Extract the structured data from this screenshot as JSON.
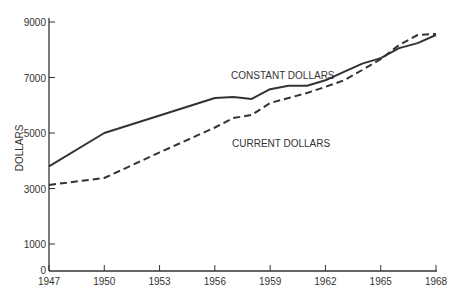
{
  "chart_data": {
    "type": "line",
    "title": "",
    "xlabel": "",
    "ylabel": "DOLLARS",
    "x_ticks": [
      "1947",
      "1950",
      "1953",
      "1956",
      "1959",
      "1962",
      "1965",
      "1968"
    ],
    "y_ticks": [
      "0",
      "1000",
      "3000",
      "5000",
      "7000",
      "9000"
    ],
    "ylim": [
      0,
      9000
    ],
    "xlim": [
      1947,
      1968
    ],
    "grid": false,
    "legend": "inline labels",
    "series": [
      {
        "name": "CONSTANT DOLLARS",
        "style": "solid",
        "x": [
          1947,
          1950,
          1956,
          1957,
          1958,
          1959,
          1960,
          1961,
          1962,
          1963,
          1964,
          1965,
          1966,
          1967,
          1968
        ],
        "values": [
          3800,
          5000,
          6260,
          6300,
          6230,
          6580,
          6700,
          6700,
          6900,
          7200,
          7500,
          7700,
          8060,
          8240,
          8530
        ]
      },
      {
        "name": "CURRENT DOLLARS",
        "style": "dashed",
        "x": [
          1947,
          1950,
          1953,
          1956,
          1957,
          1958,
          1959,
          1960,
          1961,
          1962,
          1963,
          1964,
          1965,
          1966,
          1967,
          1968
        ],
        "values": [
          3130,
          3380,
          4300,
          5200,
          5540,
          5650,
          6080,
          6260,
          6440,
          6660,
          6900,
          7270,
          7660,
          8170,
          8530,
          8570
        ]
      }
    ]
  },
  "labels": {
    "ylabel": "DOLLARS",
    "constant": "CONSTANT DOLLARS",
    "current": "CURRENT DOLLARS"
  }
}
